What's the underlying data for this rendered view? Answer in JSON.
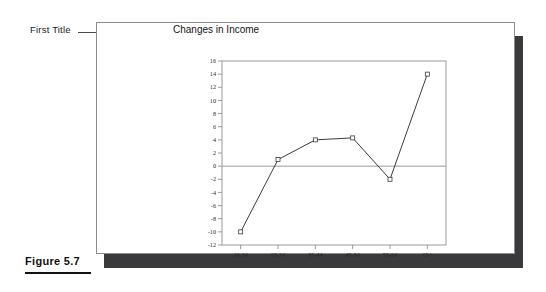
{
  "callout": {
    "label": "First Title"
  },
  "figure": {
    "caption": "Figure 5.7"
  },
  "colors": {
    "panel_border": "#8d8d8d",
    "panel_shadow": "#3a3a3c",
    "plot_border": "#9a9a9a",
    "zero_line": "#9a9a9a",
    "series_line": "#3c3c3c",
    "marker_fill": "#ffffff",
    "marker_stroke": "#3c3c3c",
    "text": "#141414"
  },
  "chart_data": {
    "type": "line",
    "title": "Changes in Income",
    "xlabel": "",
    "ylabel": "",
    "categories": [
      "16-24",
      "25-34",
      "35-44",
      "45-54",
      "55-64",
      "65+"
    ],
    "values": [
      -10,
      1,
      4,
      4.3,
      -2,
      14
    ],
    "series": [
      {
        "name": "Changes in Income",
        "values": [
          -10,
          1,
          4,
          4.3,
          -2,
          14
        ]
      }
    ],
    "ylim": [
      -12,
      16
    ],
    "ytick_step": 2,
    "yticks": [
      16,
      14,
      12,
      10,
      8,
      6,
      4,
      2,
      0,
      -2,
      -4,
      -6,
      -8,
      -10,
      -12
    ],
    "ytick_labels": [
      "16",
      "14",
      "12",
      "10",
      "8",
      "6",
      "4",
      "2",
      "0",
      "-2",
      "-4",
      "-6",
      "-8",
      "-10",
      "-12"
    ],
    "grid": false,
    "zero_line": true,
    "legend": false,
    "legend_position": "none",
    "marker": "open-square"
  }
}
